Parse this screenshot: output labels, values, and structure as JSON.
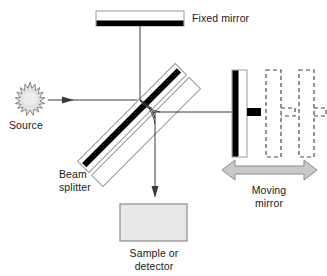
{
  "figure": {
    "background_color": "#ffffff",
    "width": 327,
    "height": 276
  },
  "labels": {
    "fixed_mirror": "Fixed mirror",
    "source": "Source",
    "beam_splitter_line1": "Beam",
    "beam_splitter_line2": "splitter",
    "moving_mirror_line1": "Moving",
    "moving_mirror_line2": "mirror",
    "sample_line1": "Sample or",
    "sample_line2": "detector"
  },
  "colors": {
    "stroke": "#3a3a3a",
    "black": "#000000",
    "plate_outline": "#9a9a9a",
    "sample_fill": "#e8e8e8",
    "sample_stroke": "#8c8c8c",
    "arrow_fill": "#c9c9c9",
    "arrow_stroke": "#8c8c8c",
    "source_fill": "#e3e3e3",
    "source_stroke": "#7a7a7a",
    "ghost_stroke": "#4a4a4a",
    "text": "#1a1a1a"
  },
  "components": {
    "fixed_mirror": {
      "kind": "mirror",
      "orientation": "horizontal",
      "body_rect": {
        "x": 96,
        "y": 11,
        "w": 88,
        "h": 15
      },
      "reflective_bar": {
        "x": 96,
        "y": 21,
        "w": 88,
        "h": 5
      },
      "stem": {
        "x1": 140,
        "y1": 26,
        "x2": 140,
        "y2": 40
      }
    },
    "beam_splitter": {
      "kind": "plate",
      "angle_deg": -45,
      "coating": "black diagonal stripe",
      "plates": 2
    },
    "moving_mirror": {
      "kind": "mirror",
      "orientation": "vertical",
      "body_rect": {
        "x": 232,
        "y": 70,
        "w": 14,
        "h": 86
      },
      "reflective_bar": {
        "x": 232,
        "y": 70,
        "w": 6,
        "h": 86
      },
      "handle": {
        "x": 246,
        "y": 108,
        "w": 14,
        "h": 8
      },
      "ghost_positions": 2,
      "travel_arrow": "double-headed horizontal"
    },
    "sample_or_detector": {
      "kind": "box",
      "rect": {
        "x": 120,
        "y": 204,
        "w": 67,
        "h": 37
      }
    },
    "source": {
      "kind": "starburst",
      "center": {
        "x": 30,
        "y": 100
      },
      "points": 18
    }
  },
  "beams": [
    {
      "name": "source-to-splitter",
      "from": "source",
      "to": "beam-splitter",
      "arrow": true,
      "direction": "right"
    },
    {
      "name": "splitter-to-fixed-mirror",
      "from": "beam-splitter",
      "to": "fixed-mirror",
      "arrow": false,
      "direction": "up"
    },
    {
      "name": "splitter-to-moving-mirror",
      "from": "beam-splitter",
      "to": "moving-mirror",
      "arrow": false,
      "direction": "right"
    },
    {
      "name": "splitter-to-detector",
      "from": "beam-splitter",
      "to": "sample-or-detector",
      "arrow": true,
      "direction": "down"
    }
  ]
}
